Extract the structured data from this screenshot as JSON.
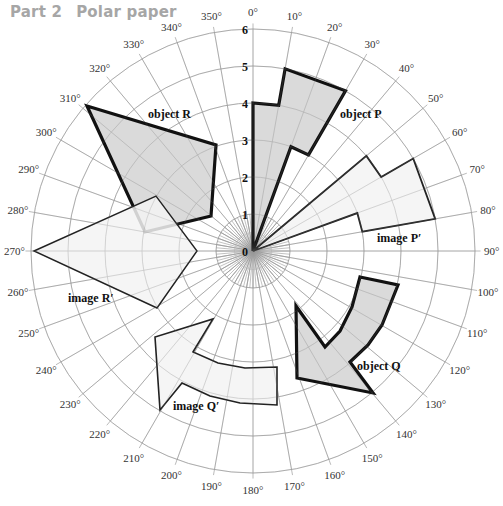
{
  "header": {
    "part": "Part 2",
    "title": "Polar paper"
  },
  "grid": {
    "center": [
      253,
      251
    ],
    "unit_px": 37,
    "rings": [
      1,
      2,
      3,
      4,
      5,
      6
    ],
    "angle_step": 10,
    "ring_labels": [
      "0",
      "1",
      "2",
      "3",
      "4",
      "5",
      "6"
    ]
  },
  "angle_labels": [
    "0°",
    "10°",
    "20°",
    "30°",
    "40°",
    "50°",
    "60°",
    "70°",
    "80°",
    "90°",
    "100°",
    "110°",
    "120°",
    "130°",
    "140°",
    "150°",
    "160°",
    "170°",
    "180°",
    "190°",
    "200°",
    "210°",
    "220°",
    "230°",
    "240°",
    "250°",
    "260°",
    "270°",
    "280°",
    "290°",
    "300°",
    "310°",
    "320°",
    "330°",
    "340°",
    "350°"
  ],
  "shapes": [
    {
      "name": "object P",
      "label": "object P",
      "fill": "#d4d4d4",
      "stroke": "#111",
      "width": 3.2,
      "points": [
        [
          0,
          0
        ],
        [
          0,
          4
        ],
        [
          10,
          4
        ],
        [
          10,
          5
        ],
        [
          30,
          5
        ],
        [
          30,
          3
        ],
        [
          20,
          3
        ],
        [
          0,
          0
        ]
      ],
      "label_pos": [
        340,
        118
      ]
    },
    {
      "name": "image P′",
      "label": "image P′",
      "fill": "#f3f3f3",
      "stroke": "#222",
      "width": 1.8,
      "points": [
        [
          0,
          0
        ],
        [
          50,
          4
        ],
        [
          60,
          4
        ],
        [
          60,
          5
        ],
        [
          80,
          5
        ],
        [
          80,
          3
        ],
        [
          70,
          3
        ],
        [
          0,
          0
        ]
      ],
      "label_pos": [
        377,
        242
      ]
    },
    {
      "name": "object Q",
      "label": "object Q",
      "fill": "#d4d4d4",
      "stroke": "#111",
      "width": 3.2,
      "polygon_px": [
        [
          360,
          277
        ],
        [
          398,
          285
        ],
        [
          390,
          305
        ],
        [
          382,
          325
        ],
        [
          368,
          345
        ],
        [
          350,
          362
        ],
        [
          373,
          393
        ],
        [
          297,
          378
        ],
        [
          296,
          306
        ],
        [
          325,
          347
        ],
        [
          340,
          331
        ],
        [
          352,
          307
        ]
      ],
      "label_pos": [
        357,
        370
      ]
    },
    {
      "name": "image Q′",
      "label": "image Q′",
      "fill": "#f3f3f3",
      "stroke": "#222",
      "width": 1.6,
      "polygon_px": [
        [
          277,
          367
        ],
        [
          277,
          405
        ],
        [
          240,
          403
        ],
        [
          210,
          396
        ],
        [
          182,
          383
        ],
        [
          160,
          410
        ],
        [
          155,
          337
        ],
        [
          213,
          319
        ],
        [
          193,
          352
        ],
        [
          218,
          363
        ],
        [
          245,
          368
        ]
      ],
      "label_pos": [
        173,
        410
      ]
    },
    {
      "name": "object R",
      "label": "object R",
      "fill": "#d4d4d4",
      "stroke": "#111",
      "width": 3.2,
      "polygon_px": [
        [
          87,
          106
        ],
        [
          216,
          145
        ],
        [
          211,
          216
        ],
        [
          145,
          232
        ]
      ],
      "label_pos": [
        148,
        118
      ]
    },
    {
      "name": "image R′",
      "label": "image R′",
      "fill": "#f3f3f3",
      "stroke": "#222",
      "width": 1.4,
      "polygon_px": [
        [
          34,
          251
        ],
        [
          156,
          196
        ],
        [
          197,
          251
        ],
        [
          157,
          308
        ]
      ],
      "label_pos": [
        68,
        302
      ]
    }
  ]
}
